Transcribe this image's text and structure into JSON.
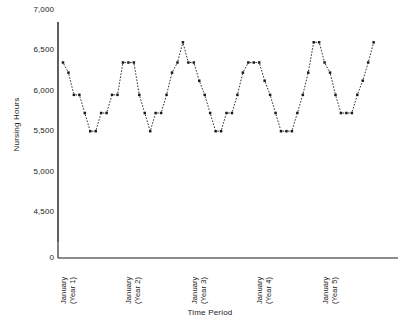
{
  "chart_data": {
    "type": "line",
    "title": "",
    "xlabel": "Time Period",
    "ylabel": "Nursing Hours",
    "ylim": [
      0,
      7000
    ],
    "yticks": [
      {
        "label": "7,000",
        "value": 7000
      },
      {
        "label": "6,500",
        "value": 6500
      },
      {
        "label": "6,000",
        "value": 6000
      },
      {
        "label": "5,500",
        "value": 5500
      },
      {
        "label": "5,000",
        "value": 5000
      },
      {
        "label": "4,500",
        "value": 4500
      },
      {
        "label": "0",
        "value": 0
      }
    ],
    "axis_break": true,
    "grid": false,
    "legend": "none",
    "marker": "filled-square",
    "line_style": "dashed-connector",
    "xticks": [
      {
        "line1": "January",
        "line2": "(Year 1)",
        "index": 0
      },
      {
        "line1": "January",
        "line2": "(Year 2)",
        "index": 12
      },
      {
        "line1": "January",
        "line2": "(Year 3)",
        "index": 24
      },
      {
        "line1": "January",
        "line2": "(Year 4)",
        "index": 36
      },
      {
        "line1": "January",
        "line2": "(Year 5)",
        "index": 48
      }
    ],
    "series": [
      {
        "name": "Nursing Hours",
        "values": [
          6350,
          6225,
          5950,
          5950,
          5725,
          5500,
          5500,
          5725,
          5725,
          5950,
          5950,
          6350,
          6350,
          6350,
          5950,
          5725,
          5500,
          5725,
          5725,
          5950,
          6225,
          6350,
          6600,
          6350,
          6350,
          6125,
          5950,
          5725,
          5500,
          5500,
          5725,
          5725,
          5950,
          6225,
          6350,
          6350,
          6350,
          6125,
          5950,
          5725,
          5500,
          5500,
          5500,
          5725,
          5950,
          6225,
          6600,
          6600,
          6350,
          6225,
          5950,
          5725,
          5725,
          5725,
          5950,
          6125,
          6350,
          6600
        ]
      }
    ]
  }
}
